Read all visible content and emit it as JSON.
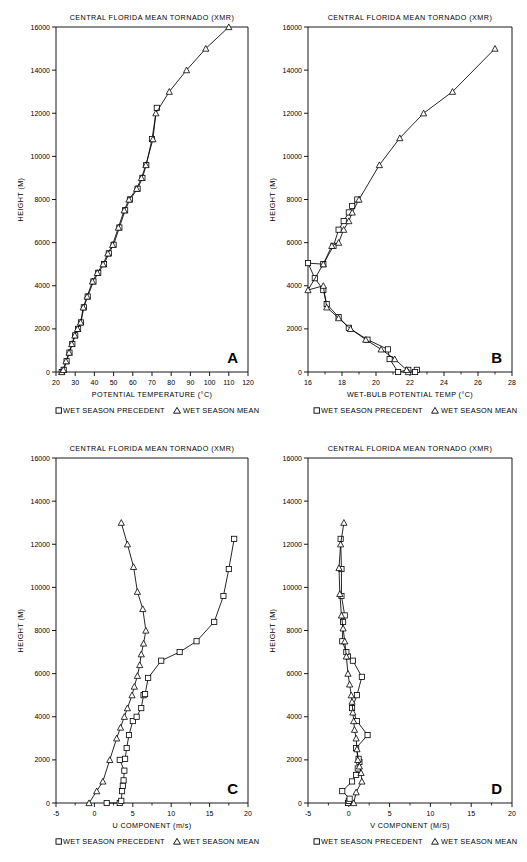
{
  "figure": {
    "common_title": "CENTRAL FLORIDA MEAN TORNADO (XMR)",
    "ylabel": "HEIGHT (M)",
    "legend": {
      "precedent_symbol": "square",
      "precedent_label": "WET SEASON PRECEDENT",
      "mean_symbol": "triangle",
      "mean_label": "WET SEASON MEAN"
    },
    "ink_color": "#000000",
    "background_color": "#ffffff"
  },
  "panels": [
    {
      "id": "A",
      "letter": "A"
    },
    {
      "id": "B",
      "letter": "B"
    },
    {
      "id": "C",
      "letter": "C"
    },
    {
      "id": "D",
      "letter": "D"
    }
  ],
  "chart_data": [
    {
      "id": "A",
      "type": "line",
      "title": "CENTRAL FLORIDA MEAN TORNADO (XMR)",
      "xlabel": "POTENTIAL TEMPERATURE (°C)",
      "ylabel": "HEIGHT (M)",
      "xlim": [
        20,
        120
      ],
      "ylim": [
        0,
        16000
      ],
      "xticks": [
        20,
        30,
        40,
        50,
        60,
        70,
        80,
        90,
        100,
        110,
        120
      ],
      "yticks": [
        0,
        2000,
        4000,
        6000,
        8000,
        10000,
        12000,
        14000,
        16000
      ],
      "grid": false,
      "legend_position": "below-axis",
      "panel_letter": "A",
      "series": [
        {
          "name": "WET SEASON PRECEDENT",
          "marker": "square",
          "x": [
            23.0,
            24.0,
            25.5,
            27.0,
            28.5,
            30.0,
            31.5,
            33.0,
            34.5,
            36.5,
            39.5,
            42.0,
            45.0,
            47.5,
            50.0,
            53.0,
            56.0,
            58.5,
            62.5,
            65.0,
            67.0,
            70.0,
            72.5
          ],
          "y": [
            0,
            100,
            500,
            900,
            1300,
            1700,
            2000,
            2300,
            3000,
            3500,
            4200,
            4600,
            5000,
            5500,
            5900,
            6700,
            7500,
            8000,
            8500,
            9000,
            9600,
            10800,
            12250
          ]
        },
        {
          "name": "WET SEASON MEAN",
          "marker": "triangle",
          "x": [
            23.0,
            23.8,
            25.2,
            26.8,
            28.2,
            29.8,
            31.2,
            32.8,
            34.2,
            36.2,
            39.0,
            41.5,
            44.5,
            47.0,
            49.5,
            52.5,
            55.5,
            58.0,
            62.0,
            64.5,
            66.8,
            70.5,
            72.0,
            79.0,
            88.0,
            98.0,
            110.0
          ],
          "y": [
            0,
            100,
            500,
            900,
            1300,
            1700,
            2000,
            2300,
            3000,
            3500,
            4200,
            4600,
            5000,
            5500,
            5900,
            6700,
            7500,
            8000,
            8500,
            9000,
            9600,
            10800,
            12000,
            13000,
            14000,
            15000,
            16000
          ]
        }
      ]
    },
    {
      "id": "B",
      "type": "line",
      "title": "CENTRAL FLORIDA MEAN TORNADO (XMR)",
      "xlabel": "WET-BULB POTENTIAL TEMP (°C)",
      "ylabel": "HEIGHT (M)",
      "xlim": [
        16,
        28
      ],
      "ylim": [
        0,
        16000
      ],
      "xticks": [
        16,
        18,
        20,
        22,
        24,
        26,
        28
      ],
      "yticks": [
        0,
        2000,
        4000,
        6000,
        8000,
        10000,
        12000,
        14000,
        16000
      ],
      "grid": false,
      "legend_position": "below-axis",
      "panel_letter": "B",
      "series": [
        {
          "name": "WET SEASON PRECEDENT",
          "marker": "square",
          "x": [
            22.4,
            22.3,
            21.9,
            21.3,
            20.8,
            20.7,
            19.5,
            18.4,
            17.8,
            17.1,
            16.9,
            16.4,
            16.0,
            16.9,
            17.5,
            17.8,
            18.1,
            18.4,
            18.6,
            18.9
          ],
          "y": [
            100,
            0,
            100,
            0,
            600,
            1050,
            1500,
            2050,
            2550,
            3150,
            3800,
            4350,
            5050,
            5000,
            5850,
            6600,
            7000,
            7400,
            7700,
            8000
          ]
        },
        {
          "name": "WET SEASON MEAN",
          "marker": "triangle",
          "x": [
            21.9,
            21.8,
            21.1,
            20.3,
            19.4,
            18.5,
            17.8,
            17.1,
            16.9,
            16.0,
            16.9,
            17.4,
            17.8,
            18.1,
            18.4,
            18.6,
            19.0,
            20.2,
            21.4,
            22.8,
            24.5,
            27.0
          ],
          "y": [
            0,
            100,
            600,
            1050,
            1500,
            2000,
            2500,
            3000,
            4000,
            3800,
            5000,
            5850,
            6000,
            6600,
            7000,
            7400,
            8000,
            9600,
            10850,
            12000,
            13000,
            15000
          ]
        }
      ]
    },
    {
      "id": "C",
      "type": "line",
      "title": "CENTRAL FLORIDA MEAN TORNADO (XMR)",
      "xlabel": "U COMPONENT (m/s)",
      "ylabel": "HEIGHT (M)",
      "xlim": [
        -5,
        20
      ],
      "ylim": [
        0,
        16000
      ],
      "xticks": [
        -5,
        0,
        5,
        10,
        15,
        20
      ],
      "yticks": [
        0,
        2000,
        4000,
        6000,
        8000,
        10000,
        12000,
        14000,
        16000
      ],
      "grid": false,
      "legend_position": "below-axis",
      "panel_letter": "C",
      "series": [
        {
          "name": "WET SEASON PRECEDENT",
          "marker": "square",
          "x": [
            1.6,
            3.3,
            3.5,
            3.6,
            3.7,
            3.8,
            3.9,
            3.3,
            4.0,
            4.2,
            4.5,
            5.0,
            5.5,
            6.1,
            6.4,
            6.6,
            7.0,
            8.7,
            11.1,
            13.3,
            15.6,
            16.8,
            17.5,
            18.2
          ],
          "y": [
            0,
            0,
            100,
            550,
            800,
            1050,
            1500,
            2000,
            2050,
            2550,
            3150,
            3800,
            4000,
            4400,
            5000,
            5050,
            5800,
            6600,
            7000,
            7500,
            8400,
            9600,
            10850,
            12250
          ]
        },
        {
          "name": "WET SEASON MEAN",
          "marker": "triangle",
          "x": [
            -0.7,
            0.3,
            1.1,
            2.0,
            2.9,
            3.4,
            3.9,
            4.3,
            4.9,
            5.2,
            5.6,
            5.9,
            6.1,
            6.4,
            6.7,
            6.3,
            5.6,
            5.1,
            4.3,
            3.5
          ],
          "y": [
            0,
            550,
            1000,
            2000,
            3000,
            3500,
            4000,
            4400,
            5000,
            5400,
            5900,
            6400,
            6900,
            7400,
            8000,
            9000,
            9800,
            10950,
            12000,
            13000
          ]
        }
      ]
    },
    {
      "id": "D",
      "type": "line",
      "title": "CENTRAL FLORIDA MEAN TORNADO (XMR)",
      "xlabel": "V COMPONENT (M/S)",
      "ylabel": "HEIGHT (M)",
      "xlim": [
        -5,
        20
      ],
      "ylim": [
        0,
        16000
      ],
      "xticks": [
        -5,
        0,
        5,
        10,
        15,
        20
      ],
      "yticks": [
        0,
        2000,
        4000,
        6000,
        8000,
        10000,
        12000,
        14000,
        16000
      ],
      "grid": false,
      "legend_position": "below-axis",
      "panel_letter": "D",
      "series": [
        {
          "name": "WET SEASON PRECEDENT",
          "marker": "square",
          "x": [
            -0.1,
            0.0,
            0.1,
            -0.8,
            0.4,
            0.9,
            1.1,
            1.3,
            1.2,
            0.9,
            2.3,
            1.0,
            0.4,
            1.0,
            1.6,
            0.5,
            -0.1,
            -0.3,
            -0.8,
            -0.7,
            -0.5,
            -0.9,
            -0.9,
            -1.0
          ],
          "y": [
            0,
            100,
            200,
            550,
            1000,
            1300,
            1600,
            1900,
            2050,
            2550,
            3150,
            3800,
            4400,
            5000,
            5850,
            6600,
            6800,
            7000,
            7500,
            8400,
            8700,
            9600,
            10850,
            12250
          ]
        },
        {
          "name": "WET SEASON MEAN",
          "marker": "triangle",
          "x": [
            0.6,
            0.9,
            1.6,
            1.5,
            1.3,
            1.1,
            1.0,
            0.9,
            0.7,
            0.6,
            0.5,
            0.4,
            0.3,
            0.1,
            -0.1,
            -0.3,
            -0.5,
            -0.7,
            -0.9,
            -1.1,
            -1.2,
            -1.0,
            -0.6
          ],
          "y": [
            0,
            500,
            1000,
            1400,
            1700,
            2000,
            2500,
            3000,
            3400,
            3800,
            4200,
            4700,
            5000,
            5500,
            6000,
            6800,
            7500,
            8100,
            8700,
            9700,
            10900,
            12000,
            13000
          ]
        }
      ]
    }
  ]
}
